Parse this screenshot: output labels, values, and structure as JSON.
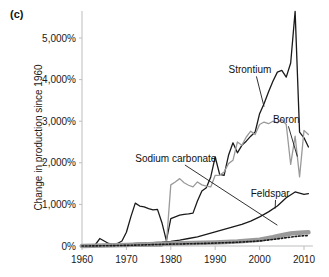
{
  "figure": {
    "panel_label": "(c)",
    "y_axis_title": "Change in production since 1960"
  },
  "chart_data": {
    "type": "line",
    "title": "",
    "subtitle": "",
    "xlabel": "",
    "ylabel": "Change in production since 1960",
    "xlim": [
      1960,
      2012
    ],
    "ylim": [
      0,
      5800
    ],
    "grid": false,
    "legend_position": "inline-annotations",
    "x_ticks": [
      1960,
      1970,
      1980,
      1990,
      2000,
      2010
    ],
    "x_tick_labels": [
      "1960",
      "1970",
      "1980",
      "1990",
      "2000",
      "2010"
    ],
    "y_ticks": [
      0,
      1000,
      2000,
      3000,
      4000,
      5000
    ],
    "y_tick_labels": [
      "0%",
      "1,000%",
      "2,000%",
      "3,000%",
      "4,000%",
      "5,000%"
    ],
    "annotations": [
      {
        "text": "Strontium",
        "x": 1993,
        "y": 4150,
        "leader_to_x": 2001,
        "leader_to_y": 3350
      },
      {
        "text": "Boron",
        "x": 2003,
        "y": 2950,
        "leader_to_x": 2008.5,
        "leader_to_y": 2150
      },
      {
        "text": "Sodium carbonate",
        "x": 1972,
        "y": 2020,
        "leader_to_x": 2004,
        "leader_to_y": 500
      },
      {
        "text": "Feldspar",
        "x": 1998,
        "y": 1180,
        "leader_to_x": 2003.5,
        "leader_to_y": 900
      }
    ],
    "series": [
      {
        "name": "Strontium",
        "color": "#1a1a1a",
        "style": "solid",
        "width": 1.3,
        "x": [
          1960,
          1961,
          1962,
          1963,
          1964,
          1965,
          1966,
          1967,
          1968,
          1969,
          1970,
          1971,
          1972,
          1973,
          1974,
          1975,
          1976,
          1977,
          1978,
          1979,
          1980,
          1981,
          1982,
          1983,
          1984,
          1985,
          1986,
          1987,
          1988,
          1989,
          1990,
          1991,
          1992,
          1993,
          1994,
          1995,
          1996,
          1997,
          1998,
          1999,
          2000,
          2001,
          2002,
          2003,
          2004,
          2005,
          2006,
          2007,
          2008,
          2009,
          2010,
          2011
        ],
        "values": [
          0,
          10,
          20,
          30,
          180,
          120,
          60,
          40,
          60,
          120,
          330,
          700,
          1030,
          960,
          940,
          900,
          870,
          880,
          560,
          130,
          660,
          700,
          740,
          760,
          770,
          790,
          1080,
          1320,
          1400,
          1660,
          2140,
          1720,
          1700,
          2180,
          2480,
          2240,
          2420,
          2520,
          2640,
          2740,
          3180,
          3420,
          3700,
          3960,
          4180,
          4220,
          4060,
          4400,
          5640,
          2740,
          2600,
          2380
        ]
      },
      {
        "name": "Boron",
        "color": "#9a9a9a",
        "style": "solid",
        "width": 1.3,
        "x": [
          1960,
          1961,
          1962,
          1963,
          1964,
          1965,
          1966,
          1967,
          1968,
          1969,
          1970,
          1971,
          1972,
          1973,
          1974,
          1975,
          1976,
          1977,
          1978,
          1979,
          1980,
          1981,
          1982,
          1983,
          1984,
          1985,
          1986,
          1987,
          1988,
          1989,
          1990,
          1991,
          1992,
          1993,
          1994,
          1995,
          1996,
          1997,
          1998,
          1999,
          2000,
          2001,
          2002,
          2003,
          2004,
          2005,
          2006,
          2007,
          2008,
          2009,
          2010,
          2011
        ],
        "values": [
          0,
          0,
          0,
          0,
          0,
          0,
          0,
          0,
          0,
          0,
          0,
          0,
          0,
          0,
          0,
          0,
          0,
          0,
          0,
          40,
          1470,
          1540,
          1620,
          1520,
          1460,
          1420,
          1540,
          1470,
          1440,
          1420,
          1700,
          1700,
          1780,
          1980,
          2060,
          2500,
          2420,
          2620,
          2760,
          2680,
          2920,
          2980,
          2940,
          3000,
          2960,
          3040,
          2920,
          1960,
          2640,
          1660,
          2780,
          2680
        ]
      },
      {
        "name": "Feldspar",
        "color": "#1a1a1a",
        "style": "solid",
        "width": 1.3,
        "x": [
          1960,
          1962,
          1964,
          1966,
          1968,
          1970,
          1972,
          1974,
          1976,
          1978,
          1980,
          1982,
          1984,
          1986,
          1988,
          1990,
          1992,
          1994,
          1996,
          1998,
          2000,
          2002,
          2004,
          2006,
          2008,
          2010,
          2011
        ],
        "values": [
          0,
          10,
          20,
          20,
          30,
          40,
          60,
          70,
          80,
          90,
          110,
          140,
          180,
          220,
          280,
          340,
          400,
          460,
          520,
          600,
          700,
          820,
          960,
          1160,
          1300,
          1240,
          1260
        ]
      },
      {
        "name": "unlabeled-gray-band",
        "color": "#9a9a9a",
        "style": "solid",
        "width": 4.5,
        "x": [
          1960,
          1965,
          1970,
          1975,
          1980,
          1985,
          1990,
          1995,
          2000,
          2003,
          2005,
          2007,
          2009,
          2011
        ],
        "values": [
          0,
          10,
          25,
          45,
          60,
          70,
          85,
          110,
          150,
          210,
          260,
          300,
          320,
          330
        ]
      },
      {
        "name": "unlabeled-dotted",
        "color": "#1a1a1a",
        "style": "dotted",
        "width": 1.6,
        "x": [
          1960,
          1965,
          1970,
          1975,
          1980,
          1985,
          1990,
          1995,
          2000,
          2004,
          2007,
          2009,
          2011
        ],
        "values": [
          0,
          5,
          15,
          30,
          45,
          55,
          70,
          90,
          120,
          170,
          215,
          240,
          250
        ]
      }
    ]
  }
}
